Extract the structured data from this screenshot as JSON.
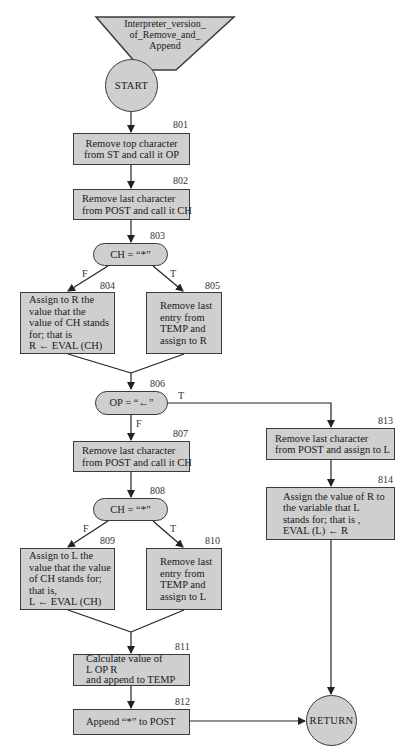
{
  "diagram": {
    "title": "Interpreter_version_\nof_Remove_and_\nAppend",
    "start_label": "START",
    "end_label": "RETURN",
    "colors": {
      "fill": "#cfcfcf",
      "stroke": "#3a3a3a",
      "line": "#222222"
    },
    "steps": {
      "s801": {
        "id": "801",
        "text": "Remove top character\nfrom ST and call it OP"
      },
      "s802": {
        "id": "802",
        "text": "Remove last character\nfrom POST and call it CH"
      },
      "s803": {
        "id": "803",
        "text": "CH = “*”"
      },
      "s804": {
        "id": "804",
        "text": "Assign to R the\nvalue that the\nvalue of CH stands\nfor; that is\nR ← EVAL (CH)"
      },
      "s805": {
        "id": "805",
        "text": "Remove last\nentry from\nTEMP and\nassign to R"
      },
      "s806": {
        "id": "806",
        "text": "OP = “←”"
      },
      "s807": {
        "id": "807",
        "text": "Remove last character\nfrom POST and call it CH"
      },
      "s808": {
        "id": "808",
        "text": "CH = “*”"
      },
      "s809": {
        "id": "809",
        "text": "Assign to L the\nvalue that the value\nof CH stands for;\nthat is,\nL ← EVAL (CH)"
      },
      "s810": {
        "id": "810",
        "text": "Remove last\nentry from\nTEMP and\nassign to L"
      },
      "s811": {
        "id": "811",
        "text": "Calculate value of\nL OP R\nand append to TEMP"
      },
      "s812": {
        "id": "812",
        "text": "Append “*” to POST"
      },
      "s813": {
        "id": "813",
        "text": "Remove last character\nfrom POST and assign to L"
      },
      "s814": {
        "id": "814",
        "text": "Assign the value of R to\nthe variable that L\nstands for; that is ,\nEVAL (L) ← R"
      }
    },
    "branches": {
      "true_label": "T",
      "false_label": "F"
    }
  }
}
